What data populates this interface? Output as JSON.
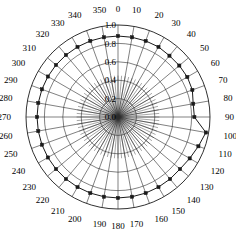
{
  "chart_data": {
    "type": "line",
    "title": "",
    "subtitle": "",
    "xlabel": "",
    "ylabel": "",
    "projection": "polar",
    "theta_direction": "clockwise",
    "theta_zero_location": "N",
    "grid": true,
    "legend": null,
    "marker": "square",
    "marker_color": "#1a1a1a",
    "line_color": "#1a1a1a",
    "rlim": [
      0.0,
      1.0
    ],
    "rticks": [
      0.0,
      0.2,
      0.4,
      0.6,
      0.8,
      1.0
    ],
    "rtick_labels": [
      "0.0",
      "0.2",
      "0.4",
      "0.6",
      "0.8",
      "1.0"
    ],
    "theta_ticks": [
      0,
      10,
      20,
      30,
      40,
      50,
      60,
      70,
      80,
      90,
      100,
      110,
      120,
      130,
      140,
      150,
      160,
      170,
      180,
      190,
      200,
      210,
      220,
      230,
      240,
      250,
      260,
      270,
      280,
      290,
      300,
      310,
      320,
      330,
      340,
      350
    ],
    "theta_tick_labels": [
      "0",
      "10",
      "20",
      "30",
      "40",
      "50",
      "60",
      "70",
      "80",
      "90",
      "100",
      "110",
      "120",
      "130",
      "140",
      "150",
      "160",
      "170",
      "180",
      "190",
      "200",
      "210",
      "220",
      "230",
      "240",
      "250",
      "260",
      "270",
      "280",
      "290",
      "300",
      "310",
      "320",
      "330",
      "340",
      "350"
    ],
    "theta": [
      0,
      10,
      20,
      30,
      40,
      50,
      60,
      70,
      80,
      90,
      100,
      110,
      120,
      130,
      140,
      150,
      160,
      170,
      180,
      190,
      200,
      210,
      220,
      230,
      240,
      250,
      260,
      270,
      280,
      290,
      300,
      310,
      320,
      330,
      340,
      350
    ],
    "r": [
      0.88,
      0.88,
      0.88,
      0.88,
      0.87,
      0.87,
      0.87,
      0.86,
      0.83,
      0.83,
      0.97,
      0.93,
      0.9,
      0.88,
      0.88,
      0.88,
      0.88,
      0.88,
      0.88,
      0.88,
      0.88,
      0.88,
      0.88,
      0.88,
      0.88,
      0.88,
      0.88,
      0.88,
      0.88,
      0.88,
      0.88,
      0.88,
      0.88,
      0.88,
      0.88,
      0.88
    ],
    "values": [
      0.88,
      0.88,
      0.88,
      0.88,
      0.87,
      0.87,
      0.87,
      0.86,
      0.83,
      0.83,
      0.97,
      0.93,
      0.9,
      0.88,
      0.88,
      0.88,
      0.88,
      0.88,
      0.88,
      0.88,
      0.88,
      0.88,
      0.88,
      0.88,
      0.88,
      0.88,
      0.88,
      0.88,
      0.88,
      0.88,
      0.88,
      0.88,
      0.88,
      0.88,
      0.88,
      0.88
    ],
    "categories": [
      "0",
      "10",
      "20",
      "30",
      "40",
      "50",
      "60",
      "70",
      "80",
      "90",
      "100",
      "110",
      "120",
      "130",
      "140",
      "150",
      "160",
      "170",
      "180",
      "190",
      "200",
      "210",
      "220",
      "230",
      "240",
      "250",
      "260",
      "270",
      "280",
      "290",
      "300",
      "310",
      "320",
      "330",
      "340",
      "350"
    ],
    "series": [
      {
        "name": "",
        "values": [
          0.88,
          0.88,
          0.88,
          0.88,
          0.87,
          0.87,
          0.87,
          0.86,
          0.83,
          0.83,
          0.97,
          0.93,
          0.9,
          0.88,
          0.88,
          0.88,
          0.88,
          0.88,
          0.88,
          0.88,
          0.88,
          0.88,
          0.88,
          0.88,
          0.88,
          0.88,
          0.88,
          0.88,
          0.88,
          0.88,
          0.88,
          0.88,
          0.88,
          0.88,
          0.88,
          0.88
        ]
      }
    ],
    "geometry": {
      "cx": 118,
      "cy": 117,
      "r_max_px": 92,
      "minor_spoke_count": 72,
      "minor_spoke_r_frac": 0.45
    }
  }
}
